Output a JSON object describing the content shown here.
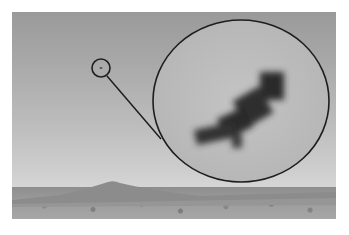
{
  "image": {
    "description": "Grayscale landscape photo of a barren, rocky plain with a low hill on the horizon; a small circled speck in the sky is shown magnified in a large circular inset.",
    "caption_partial": "– – – –",
    "colors": {
      "sky_top": "#9a9a9a",
      "sky_bottom": "#d6d6d6",
      "ground": "#9a9a9a",
      "circle_stroke": "#1e1e1e",
      "object": "#2a2a2a"
    },
    "annotations": [
      {
        "type": "small-circle",
        "cx": 101,
        "cy": 68,
        "r": 9
      },
      {
        "type": "connector-line",
        "from": [
          108,
          76
        ],
        "to": [
          162,
          140
        ]
      },
      {
        "type": "magnified-circle",
        "cx": 241,
        "cy": 101,
        "rx": 88,
        "ry": 81
      }
    ]
  }
}
